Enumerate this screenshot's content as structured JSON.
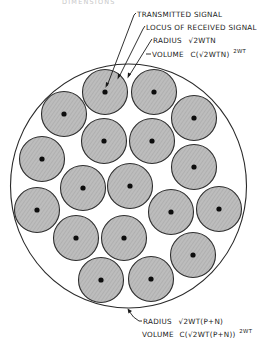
{
  "header": {
    "partial_text": "DIMENSIONS"
  },
  "labels": {
    "transmitted_signal": "TRANSMITTED SIGNAL",
    "locus_received_signal": "LOCUS OF RECEIVED SIGNAL",
    "noise_radius_prefix": "RADIUS",
    "noise_radius_value": "√2WTN",
    "noise_volume_prefix": "VOLUME",
    "noise_volume_value": "C(√2WTN)",
    "noise_volume_exponent": "2WT",
    "total_radius_prefix": "RADIUS",
    "total_radius_value": "√2WT(P+N)",
    "total_volume_prefix": "VOLUME",
    "total_volume_value": "C(√2WT(P+N))",
    "total_volume_exponent": "2WT"
  },
  "colors": {
    "sphere_fill": "#b9b9b9",
    "outline": "#2e2e2e",
    "signal_dot": "#0d0d0d",
    "text": "#1a1a1a"
  },
  "outer_sphere": {
    "cx": 128.5,
    "cy": 186,
    "rx": 118,
    "ry": 122
  },
  "noise_spheres": {
    "radius": 22.5,
    "count": 18,
    "centers": [
      [
        105,
        92
      ],
      [
        154,
        92
      ],
      [
        64,
        114
      ],
      [
        194,
        118
      ],
      [
        104,
        141
      ],
      [
        152,
        141
      ],
      [
        42,
        159
      ],
      [
        194,
        167
      ],
      [
        83,
        188
      ],
      [
        130,
        186
      ],
      [
        37,
        210
      ],
      [
        171,
        212
      ],
      [
        219,
        209
      ],
      [
        76,
        238
      ],
      [
        124,
        238
      ],
      [
        193,
        255
      ],
      [
        101,
        280
      ],
      [
        151,
        279
      ]
    ]
  }
}
